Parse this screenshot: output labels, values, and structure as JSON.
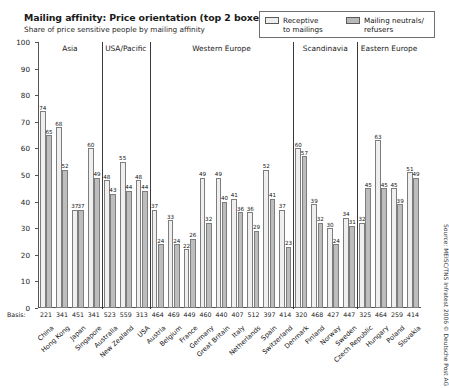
{
  "header": {
    "title": "Mailing affinity: Price orientation (top 2 boxes) in %",
    "subtitle": "Share of price sensitive people by mailing affinity"
  },
  "legend": {
    "items": [
      {
        "label": "Receptive\nto mailings",
        "line1": "Receptive",
        "line2": "to mailings",
        "color": "#efefef"
      },
      {
        "label": "Mailing neutrals/\nrefusers",
        "line1": "Mailing neutrals/",
        "line2": "refusers",
        "color": "#bdbdbd"
      }
    ]
  },
  "axis": {
    "basis_label": "Basis:",
    "y_ticks": [
      "0",
      "10",
      "20",
      "30",
      "40",
      "50",
      "60",
      "70",
      "80",
      "90",
      "100"
    ]
  },
  "source": "Source: MEISC/TNS Infratest 2006 © Deutsche Post AG",
  "regions": [
    {
      "name": "Asia",
      "count": 4
    },
    {
      "name": "USA/Pacific",
      "count": 3
    },
    {
      "name": "Western Europe",
      "count": 9
    },
    {
      "name": "Scandinavia",
      "count": 4
    },
    {
      "name": "Eastern Europe",
      "count": 4
    }
  ],
  "chart_data": {
    "type": "bar",
    "title": "Mailing affinity: Price orientation (top 2 boxes) in %",
    "subtitle": "Share of price sensitive people by mailing affinity",
    "xlabel": "",
    "ylabel": "%",
    "ylim": [
      0,
      100
    ],
    "ytick_step": 10,
    "grid": false,
    "legend_position": "top-right",
    "categories": [
      "China",
      "Hong Kong",
      "Japan",
      "Singapore",
      "Australia",
      "New Zealand",
      "USA",
      "Austria",
      "Belgium",
      "France",
      "Germany",
      "Great Britain",
      "Italy",
      "Netherlands",
      "Spain",
      "Switzerland",
      "Denmark",
      "Finland",
      "Norway",
      "Sweden",
      "Czech Republic",
      "Hungary",
      "Poland",
      "Slovakia"
    ],
    "basis": [
      221,
      341,
      451,
      341,
      523,
      559,
      313,
      464,
      469,
      449,
      460,
      440,
      407,
      512,
      397,
      414,
      320,
      468,
      427,
      447,
      325,
      464,
      259,
      414
    ],
    "series": [
      {
        "name": "Receptive to mailings",
        "color": "#efefef",
        "values": [
          74,
          68,
          37,
          60,
          48,
          55,
          48,
          37,
          33,
          22,
          49,
          49,
          41,
          36,
          52,
          37,
          60,
          39,
          30,
          34,
          32,
          63,
          45,
          51
        ]
      },
      {
        "name": "Mailing neutrals/refusers",
        "color": "#bdbdbd",
        "values": [
          65,
          52,
          37,
          49,
          43,
          44,
          44,
          24,
          24,
          26,
          32,
          40,
          36,
          29,
          41,
          23,
          57,
          32,
          24,
          31,
          45,
          45,
          39,
          49
        ]
      }
    ]
  }
}
